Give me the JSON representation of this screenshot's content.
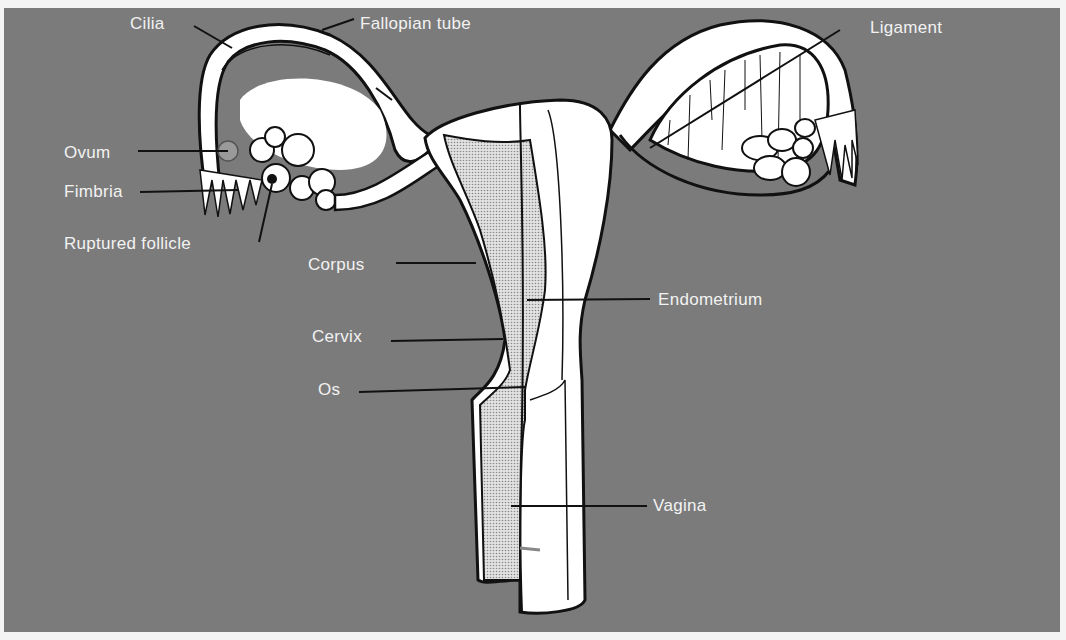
{
  "diagram": {
    "colors": {
      "background": "#7b7b7b",
      "frame": "#f4f4f4",
      "organ_fill": "#ffffff",
      "outline": "#111111",
      "endometrium_fill": "#cfcfcf",
      "label_text": "#f2f2f2"
    },
    "labels": [
      {
        "id": "cilia",
        "text": "Cilia",
        "x": 130,
        "y": 14
      },
      {
        "id": "fallopian-tube",
        "text": "Fallopian tube",
        "x": 360,
        "y": 14
      },
      {
        "id": "ligament",
        "text": "Ligament",
        "x": 870,
        "y": 18
      },
      {
        "id": "ovum",
        "text": "Ovum",
        "x": 64,
        "y": 143
      },
      {
        "id": "fimbria",
        "text": "Fimbria",
        "x": 64,
        "y": 182
      },
      {
        "id": "ruptured-follicle",
        "text": "Ruptured follicle",
        "x": 64,
        "y": 234
      },
      {
        "id": "corpus",
        "text": "Corpus",
        "x": 308,
        "y": 255
      },
      {
        "id": "endometrium",
        "text": "Endometrium",
        "x": 658,
        "y": 290
      },
      {
        "id": "cervix",
        "text": "Cervix",
        "x": 312,
        "y": 327
      },
      {
        "id": "os",
        "text": "Os",
        "x": 318,
        "y": 380
      },
      {
        "id": "vagina",
        "text": "Vagina",
        "x": 653,
        "y": 496
      }
    ]
  }
}
